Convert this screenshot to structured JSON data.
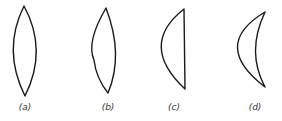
{
  "figure": {
    "stroke_color": "#1a1a1a",
    "lenses": [
      {
        "id": "a",
        "label": "(a)",
        "shape": "symmetric biconvex"
      },
      {
        "id": "b",
        "label": "(b)",
        "shape": "asymmetric biconvex"
      },
      {
        "id": "c",
        "label": "(c)",
        "shape": "plano-convex"
      },
      {
        "id": "d",
        "label": "(d)",
        "shape": "convex meniscus"
      }
    ]
  }
}
